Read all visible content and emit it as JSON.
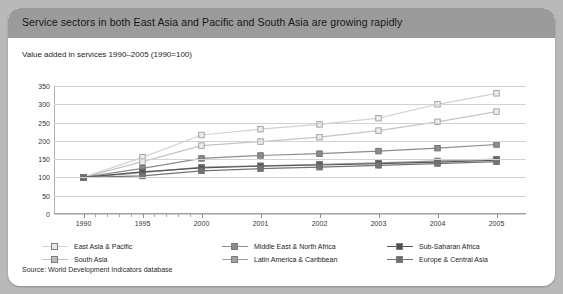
{
  "card": {
    "title": "Service sectors in both East Asia and Pacific and South Asia are growing rapidly",
    "subtitle": "Value added in services 1990–2005 (1990=100)",
    "source": "Source: World Development Indicators database"
  },
  "chart_data": {
    "type": "line",
    "title": "Value added in services 1990–2005 (1990=100)",
    "xlabel": "",
    "ylabel": "",
    "categories": [
      "1990",
      "1995",
      "2000",
      "2001",
      "2002",
      "2003",
      "2004",
      "2005"
    ],
    "ylim": [
      0,
      350
    ],
    "ytick_step": 50,
    "yticks": [
      "350",
      "300",
      "250",
      "200",
      "150",
      "100",
      "50",
      "0"
    ],
    "grid": true,
    "legend_position": "bottom",
    "series": [
      {
        "name": "East Asia & Pacific",
        "color": "#d2d2d2",
        "marker": "open-square",
        "values": [
          100,
          155,
          216,
          232,
          245,
          262,
          300,
          330
        ]
      },
      {
        "name": "South Asia",
        "color": "#c4c4c4",
        "marker": "open-square",
        "values": [
          100,
          143,
          187,
          198,
          210,
          228,
          252,
          280
        ]
      },
      {
        "name": "Middle East & North Africa",
        "color": "#8c8c8c",
        "marker": "filled-square",
        "values": [
          100,
          125,
          152,
          160,
          165,
          172,
          180,
          190
        ]
      },
      {
        "name": "Latin America & Caribbean",
        "color": "#a0a0a0",
        "marker": "filled-square",
        "values": [
          100,
          113,
          128,
          132,
          136,
          140,
          145,
          150
        ]
      },
      {
        "name": "Sub-Saharan Africa",
        "color": "#555555",
        "marker": "filled-square",
        "values": [
          100,
          115,
          126,
          131,
          134,
          138,
          142,
          147
        ]
      },
      {
        "name": "Europe & Central Asia",
        "color": "#747474",
        "marker": "filled-square",
        "values": [
          100,
          104,
          118,
          124,
          128,
          133,
          138,
          143
        ]
      }
    ]
  },
  "legend": {
    "items": [
      {
        "label": "East Asia & Pacific",
        "color": "#d2d2d2",
        "fill": "#e8e8e8"
      },
      {
        "label": "Middle East & North Africa",
        "color": "#8c8c8c",
        "fill": "#8c8c8c"
      },
      {
        "label": "Sub-Saharan Africa",
        "color": "#555555",
        "fill": "#4f4f4f"
      },
      {
        "label": "South Asia",
        "color": "#c4c4c4",
        "fill": "#bdbdbd"
      },
      {
        "label": "Latin America & Caribbean",
        "color": "#a0a0a0",
        "fill": "#a0a0a0"
      },
      {
        "label": "Europe & Central Asia",
        "color": "#747474",
        "fill": "#6f6f6f"
      }
    ]
  }
}
